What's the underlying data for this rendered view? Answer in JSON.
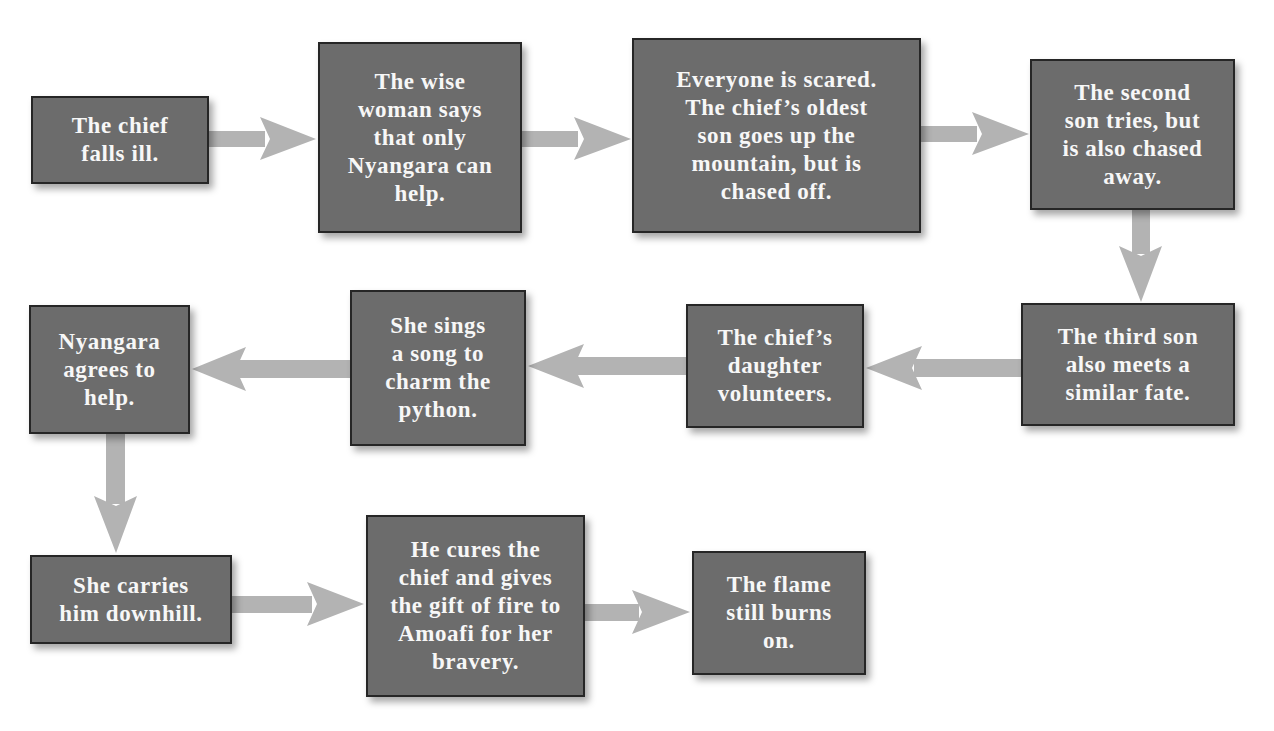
{
  "diagram": {
    "type": "flowchart",
    "colors": {
      "box_fill": "#6c6c6c",
      "box_border": "#262626",
      "box_text": "#f7f7f7",
      "arrow": "#b3b3b3",
      "background": "#ffffff"
    },
    "steps": [
      {
        "id": 1,
        "text": "The chief\nfalls ill."
      },
      {
        "id": 2,
        "text": "The wise\nwoman says\nthat only\nNyangara can\nhelp."
      },
      {
        "id": 3,
        "text": "Everyone is scared.\nThe chief’s oldest\nson goes up the\nmountain, but is\nchased off."
      },
      {
        "id": 4,
        "text": "The second\nson tries, but\nis also chased\naway."
      },
      {
        "id": 5,
        "text": "The third son\nalso meets a\nsimilar fate."
      },
      {
        "id": 6,
        "text": "The chief’s\ndaughter\nvolunteers."
      },
      {
        "id": 7,
        "text": "She sings\na song to\ncharm the\npython."
      },
      {
        "id": 8,
        "text": "Nyangara\nagrees to\nhelp."
      },
      {
        "id": 9,
        "text": "She carries\nhim downhill."
      },
      {
        "id": 10,
        "text": "He cures the\nchief and gives\nthe gift of fire to\nAmoafi for her\nbravery."
      },
      {
        "id": 11,
        "text": "The flame\nstill burns\non."
      }
    ],
    "connections": [
      {
        "from": 1,
        "to": 2,
        "direction": "right"
      },
      {
        "from": 2,
        "to": 3,
        "direction": "right"
      },
      {
        "from": 3,
        "to": 4,
        "direction": "right"
      },
      {
        "from": 4,
        "to": 5,
        "direction": "down"
      },
      {
        "from": 5,
        "to": 6,
        "direction": "left"
      },
      {
        "from": 6,
        "to": 7,
        "direction": "left"
      },
      {
        "from": 7,
        "to": 8,
        "direction": "left"
      },
      {
        "from": 8,
        "to": 9,
        "direction": "down"
      },
      {
        "from": 9,
        "to": 10,
        "direction": "right"
      },
      {
        "from": 10,
        "to": 11,
        "direction": "right"
      }
    ]
  }
}
